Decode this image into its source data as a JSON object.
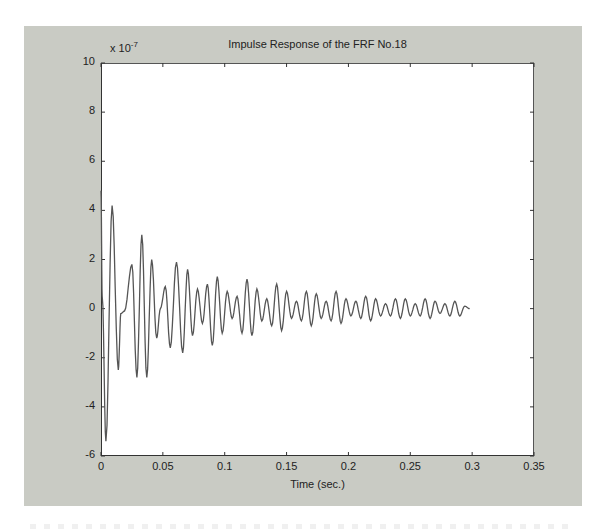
{
  "chart_data": {
    "type": "line",
    "title": "Impulse Response of the FRF  No.18",
    "xlabel": "Time (sec.)",
    "ylabel": "",
    "y_scale_label": "x 10",
    "y_scale_exponent": "-7",
    "xlim": [
      0,
      0.35
    ],
    "ylim": [
      -6,
      10
    ],
    "x_ticks": [
      "0",
      "0.05",
      "0.1",
      "0.15",
      "0.2",
      "0.25",
      "0.3",
      "0.35"
    ],
    "y_ticks": [
      "10",
      "8",
      "6",
      "4",
      "2",
      "0",
      "-2",
      "-4",
      "-6"
    ],
    "grid": false,
    "line_color": "#555555",
    "series": [
      {
        "name": "Impulse response",
        "x": [
          0.0,
          0.001,
          0.004,
          0.009,
          0.014,
          0.016,
          0.019,
          0.025,
          0.029,
          0.033,
          0.037,
          0.041,
          0.045,
          0.048,
          0.052,
          0.056,
          0.061,
          0.066,
          0.07,
          0.074,
          0.078,
          0.082,
          0.086,
          0.09,
          0.094,
          0.098,
          0.102,
          0.106,
          0.11,
          0.114,
          0.118,
          0.122,
          0.126,
          0.13,
          0.134,
          0.138,
          0.142,
          0.146,
          0.15,
          0.154,
          0.158,
          0.162,
          0.166,
          0.17,
          0.174,
          0.178,
          0.182,
          0.186,
          0.19,
          0.194,
          0.198,
          0.202,
          0.206,
          0.21,
          0.214,
          0.218,
          0.222,
          0.226,
          0.23,
          0.234,
          0.238,
          0.242,
          0.246,
          0.25,
          0.254,
          0.258,
          0.262,
          0.266,
          0.27,
          0.274,
          0.278,
          0.282,
          0.286,
          0.29,
          0.294,
          0.298
        ],
        "y": [
          4.8,
          0.5,
          -5.4,
          4.2,
          -2.5,
          -0.2,
          -0.1,
          1.8,
          -2.8,
          3.0,
          -2.8,
          2.0,
          -1.2,
          0.0,
          0.9,
          -1.6,
          1.9,
          -1.8,
          1.6,
          -1.1,
          0.8,
          -0.6,
          1.0,
          -1.5,
          1.3,
          -1.0,
          0.7,
          -0.4,
          0.5,
          -1.0,
          1.2,
          -1.1,
          0.8,
          -0.5,
          0.4,
          -0.7,
          1.0,
          -0.9,
          0.7,
          -0.4,
          0.3,
          -0.5,
          0.7,
          -0.7,
          0.6,
          -0.4,
          0.3,
          -0.5,
          0.7,
          -0.6,
          0.4,
          -0.3,
          0.3,
          -0.4,
          0.5,
          -0.5,
          0.4,
          -0.3,
          0.2,
          -0.3,
          0.4,
          -0.4,
          0.4,
          -0.3,
          0.2,
          -0.3,
          0.4,
          -0.4,
          0.3,
          -0.2,
          0.2,
          -0.3,
          0.3,
          -0.3,
          0.1,
          0.0
        ]
      }
    ]
  }
}
